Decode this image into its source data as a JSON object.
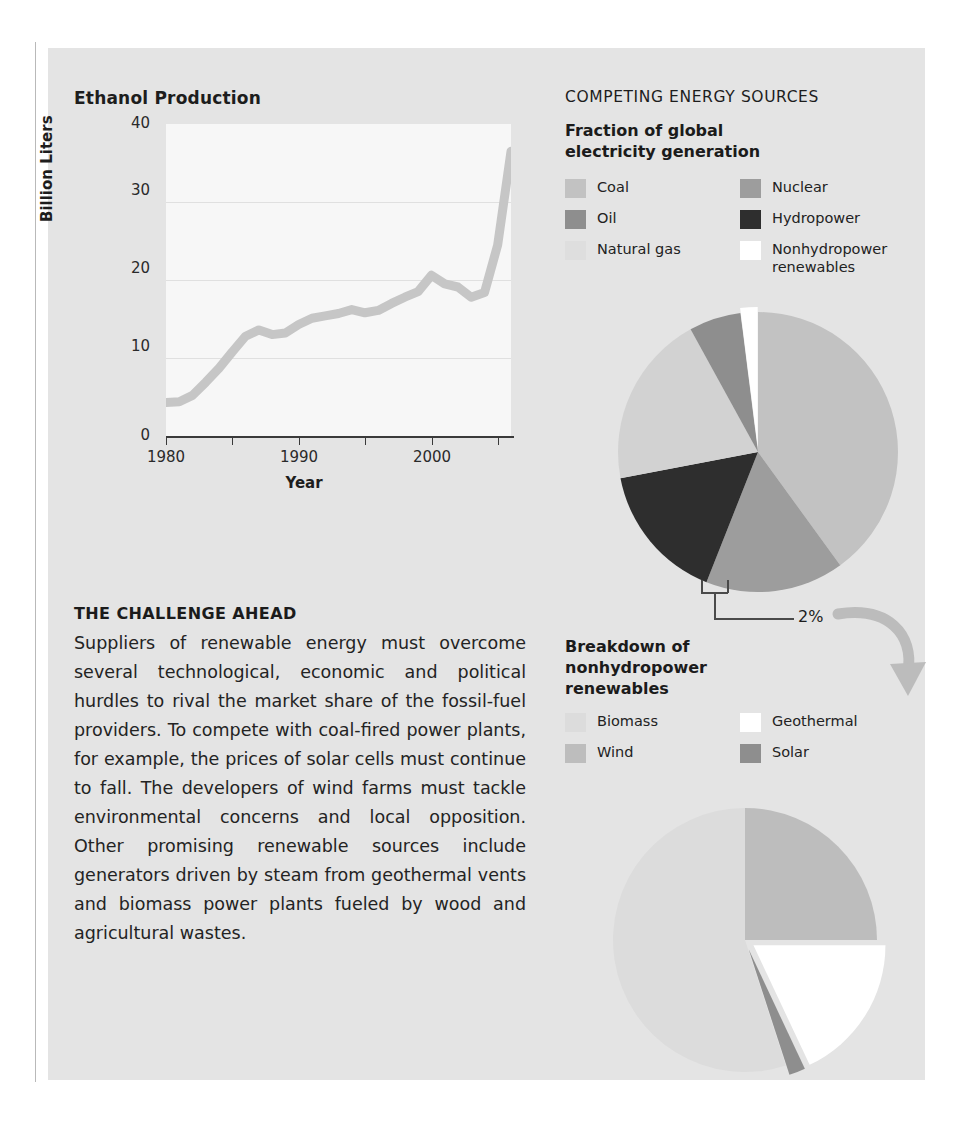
{
  "page": {
    "background": "#ffffff",
    "panel_color": "#e4e4e4"
  },
  "left_column": {
    "chart_title": "Ethanol Production",
    "axis": {
      "ylabel": "Billion Liters",
      "xlabel": "Year",
      "yticks": [
        "40",
        "30",
        "20",
        "10",
        "0"
      ],
      "xticks": [
        "1980",
        "1990",
        "2000"
      ]
    },
    "article": {
      "heading": "THE CHALLENGE AHEAD",
      "paragraph": "Suppliers of renewable energy must overcome several technological, economic and political hurdles to rival the market share of the fossil-fuel providers. To compete with coal-fired power plants, for example, the prices of solar cells must continue to fall. The developers of wind farms must tackle environmental concerns and local opposition. Other promising renewable sources include generators driven by steam from geothermal vents and biomass power plants fueled by wood and agricultural wastes."
    }
  },
  "right_column": {
    "section_title": "COMPETING ENERGY SOURCES",
    "pie1_title": "Fraction of global\nelectricity generation",
    "pie1_title_line1": "Fraction of global",
    "pie1_title_line2": "electricity generation",
    "pie1_legend_left": [
      {
        "label": "Coal",
        "color": "#c2c2c2"
      },
      {
        "label": "Oil",
        "color": "#8e8e8e"
      },
      {
        "label": "Natural gas",
        "color": "#dedede"
      }
    ],
    "pie1_legend_right": [
      {
        "label": "Nuclear",
        "color": "#9d9d9d"
      },
      {
        "label": "Hydropower",
        "color": "#2e2e2e"
      },
      {
        "label": "Nonhydropower renewables",
        "color": "#ffffff"
      }
    ],
    "callout": {
      "value": "2%",
      "points_to": "Nonhydropower renewables"
    },
    "pie2_title_line1": "Breakdown of",
    "pie2_title_line2": "nonhydropower",
    "pie2_title_line3": "renewables",
    "pie2_legend_left": [
      {
        "label": "Biomass",
        "color": "#dcdcdc"
      },
      {
        "label": "Wind",
        "color": "#bdbdbd"
      }
    ],
    "pie2_legend_right": [
      {
        "label": "Geothermal",
        "color": "#ffffff"
      },
      {
        "label": "Solar",
        "color": "#8e8e8e"
      }
    ]
  },
  "chart_data": [
    {
      "type": "line",
      "title": "Ethanol Production",
      "xlabel": "Year",
      "ylabel": "Billion Liters",
      "xlim": [
        1980,
        2006
      ],
      "ylim": [
        0,
        40
      ],
      "yticks": [
        0,
        10,
        20,
        30,
        40
      ],
      "xticks": [
        1980,
        1990,
        2000
      ],
      "grid": true,
      "line_color": "#c6c6c6",
      "x": [
        1980,
        1981,
        1982,
        1983,
        1984,
        1985,
        1986,
        1987,
        1988,
        1989,
        1990,
        1991,
        1992,
        1993,
        1994,
        1995,
        1996,
        1997,
        1998,
        1999,
        2000,
        2001,
        2002,
        2003,
        2004,
        2005,
        2006
      ],
      "values": [
        4.3,
        4.4,
        5.2,
        6.9,
        8.7,
        10.8,
        12.8,
        13.6,
        13.0,
        13.2,
        14.3,
        15.1,
        15.4,
        15.7,
        16.2,
        15.8,
        16.1,
        17.0,
        17.8,
        18.5,
        20.6,
        19.5,
        19.1,
        17.8,
        18.4,
        24.5,
        36.5
      ]
    },
    {
      "type": "pie",
      "title": "Fraction of global electricity generation",
      "legend_position": "above",
      "labels": [
        "Coal",
        "Nuclear",
        "Hydropower",
        "Natural gas",
        "Oil",
        "Nonhydropower renewables"
      ],
      "values": [
        40,
        16,
        16,
        20,
        6,
        2
      ],
      "colors": [
        "#c2c2c2",
        "#9d9d9d",
        "#2e2e2e",
        "#d2d2d2",
        "#8e8e8e",
        "#ffffff"
      ],
      "annotations": [
        "2%"
      ]
    },
    {
      "type": "pie",
      "title": "Breakdown of nonhydropower renewables",
      "legend_position": "above",
      "labels": [
        "Biomass",
        "Wind",
        "Geothermal",
        "Solar"
      ],
      "values": [
        55,
        25,
        18,
        2
      ],
      "colors": [
        "#dcdcdc",
        "#bdbdbd",
        "#ffffff",
        "#8e8e8e"
      ]
    }
  ]
}
